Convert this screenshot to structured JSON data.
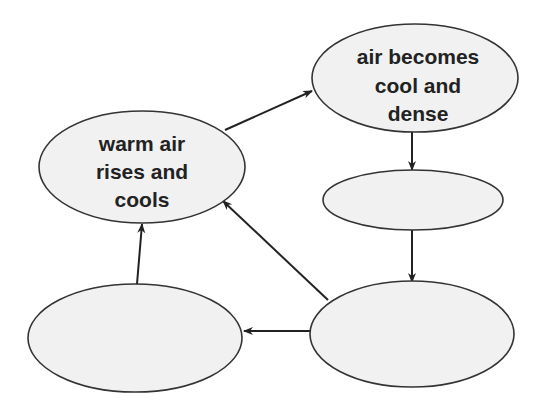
{
  "diagram": {
    "type": "cycle-flow",
    "colors": {
      "node_fill": "#f1f1f1",
      "node_stroke": "#333333",
      "arrow": "#222222",
      "text": "#222222"
    },
    "nodes": [
      {
        "id": "n1",
        "label_lines": [
          "warm air",
          "rises and",
          "cools"
        ],
        "cx": 142,
        "cy": 167,
        "rx": 103,
        "ry": 56
      },
      {
        "id": "n2",
        "label_lines": [
          "air becomes",
          "cool and",
          "dense"
        ],
        "cx": 415,
        "cy": 78,
        "rx": 103,
        "ry": 54
      },
      {
        "id": "n3",
        "label_lines": [],
        "cx": 413,
        "cy": 200,
        "rx": 90,
        "ry": 30
      },
      {
        "id": "n4",
        "label_lines": [],
        "cx": 412,
        "cy": 334,
        "rx": 102,
        "ry": 53
      },
      {
        "id": "n5",
        "label_lines": [],
        "cx": 135,
        "cy": 338,
        "rx": 107,
        "ry": 54
      }
    ],
    "edges": [
      {
        "from": "n1",
        "to": "n2"
      },
      {
        "from": "n2",
        "to": "n3"
      },
      {
        "from": "n3",
        "to": "n4"
      },
      {
        "from": "n4",
        "to": "n1"
      },
      {
        "from": "n4",
        "to": "n5"
      },
      {
        "from": "n5",
        "to": "n1"
      }
    ]
  },
  "labels": {
    "n1": {
      "line1": "warm air",
      "line2": "rises and",
      "line3": "cools"
    },
    "n2": {
      "line1": "air becomes",
      "line2": "cool and",
      "line3": "dense"
    }
  }
}
